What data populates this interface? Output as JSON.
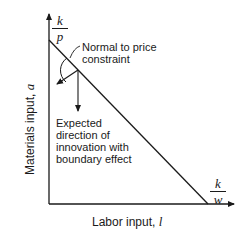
{
  "diagram": {
    "axes": {
      "y_label": "Materials input, ",
      "y_var": "a",
      "x_label": "Labor input, ",
      "x_var": "l"
    },
    "intercepts": {
      "y": {
        "numerator": "k",
        "denominator": "p"
      },
      "x": {
        "numerator": "k",
        "denominator": "w"
      }
    },
    "annotations": {
      "normal": [
        "Normal to price",
        "constraint"
      ],
      "expected": [
        "Expected",
        "direction of",
        "innovation with",
        "boundary effect"
      ]
    },
    "colors": {
      "line": "#1a1a1a",
      "background": "#ffffff"
    }
  }
}
